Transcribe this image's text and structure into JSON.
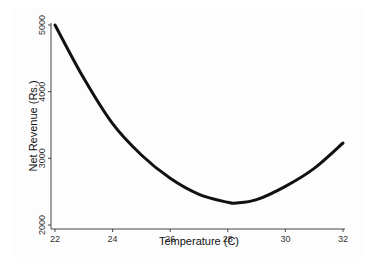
{
  "chart_data": {
    "type": "line",
    "title": "",
    "xlabel": "Temperature (C)",
    "ylabel": "Net Revenue (Rs.)",
    "xlim": [
      22,
      32
    ],
    "ylim": [
      2000,
      5000
    ],
    "x_ticks": [
      "22",
      "24",
      "26",
      "28",
      "30",
      "32"
    ],
    "y_ticks": [
      "2000",
      "3000",
      "4000",
      "5000"
    ],
    "grid": false,
    "legend": null,
    "series": [
      {
        "name": "Net Revenue",
        "color": "#111111",
        "x": [
          22,
          23,
          24,
          25,
          26,
          27,
          28,
          28.3,
          29,
          30,
          31,
          32
        ],
        "y": [
          5000,
          4200,
          3520,
          3050,
          2700,
          2460,
          2340,
          2330,
          2380,
          2580,
          2850,
          3230
        ]
      }
    ]
  }
}
